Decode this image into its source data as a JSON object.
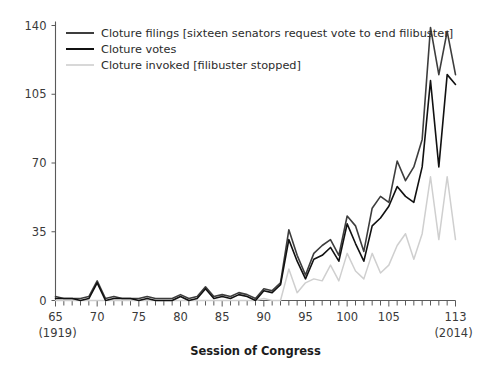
{
  "chart_data": {
    "type": "line",
    "title": "",
    "xlabel": "Session of Congress",
    "ylabel": "",
    "xlim": [
      65,
      113
    ],
    "ylim": [
      0,
      140
    ],
    "grid": false,
    "legend_position": "top-left",
    "x": [
      65,
      66,
      67,
      68,
      69,
      70,
      71,
      72,
      73,
      74,
      75,
      76,
      77,
      78,
      79,
      80,
      81,
      82,
      83,
      84,
      85,
      86,
      87,
      88,
      89,
      90,
      91,
      92,
      93,
      94,
      95,
      96,
      97,
      98,
      99,
      100,
      101,
      102,
      103,
      104,
      105,
      106,
      107,
      108,
      109,
      110,
      111,
      112,
      113
    ],
    "xticks": [
      65,
      70,
      75,
      80,
      85,
      90,
      95,
      100,
      105,
      113
    ],
    "xtick_labels": [
      "65",
      "70",
      "75",
      "80",
      "85",
      "90",
      "95",
      "100",
      "105",
      "113"
    ],
    "yticks": [
      0,
      35,
      70,
      105,
      140
    ],
    "ytick_labels": [
      "0",
      "35",
      "70",
      "105",
      "140"
    ],
    "x_start_year": "(1919)",
    "x_end_year": "(2014)",
    "series": [
      {
        "name": "Cloture filings [sixteen senators request vote to end filibuster]",
        "color": "#3d3d3d",
        "width": 1.6,
        "values": [
          2,
          1,
          1,
          1,
          2,
          10,
          1,
          2,
          1,
          1,
          1,
          2,
          1,
          1,
          1,
          3,
          1,
          2,
          7,
          2,
          3,
          2,
          4,
          3,
          1,
          6,
          5,
          9,
          36,
          23,
          13,
          24,
          28,
          31,
          23,
          43,
          38,
          25,
          47,
          53,
          50,
          71,
          61,
          68,
          82,
          139,
          115,
          137,
          115
        ]
      },
      {
        "name": "Cloture votes",
        "color": "#111111",
        "width": 1.6,
        "values": [
          1,
          1,
          1,
          0,
          1,
          9,
          0,
          1,
          1,
          1,
          0,
          1,
          0,
          0,
          0,
          2,
          0,
          1,
          6,
          1,
          2,
          1,
          3,
          2,
          0,
          5,
          4,
          8,
          31,
          20,
          11,
          21,
          23,
          27,
          20,
          39,
          29,
          20,
          38,
          42,
          48,
          58,
          53,
          50,
          68,
          112,
          68,
          115,
          110
        ]
      },
      {
        "name": "Cloture invoked [filibuster stopped]",
        "color": "#cfcfcf",
        "width": 1.5,
        "values": [
          0,
          0,
          0,
          0,
          0,
          0,
          0,
          0,
          0,
          0,
          0,
          0,
          0,
          0,
          0,
          0,
          0,
          0,
          0,
          0,
          0,
          0,
          0,
          0,
          0,
          1,
          0,
          0,
          16,
          4,
          9,
          11,
          10,
          18,
          10,
          24,
          15,
          11,
          24,
          14,
          18,
          28,
          34,
          21,
          34,
          63,
          31,
          63,
          31
        ]
      }
    ]
  },
  "legend": {
    "items": [
      {
        "label": "Cloture filings [sixteen senators request vote to end filibuster]",
        "color": "#3d3d3d"
      },
      {
        "label": "Cloture votes",
        "color": "#111111"
      },
      {
        "label": "Cloture invoked [filibuster stopped]",
        "color": "#cfcfcf"
      }
    ]
  }
}
